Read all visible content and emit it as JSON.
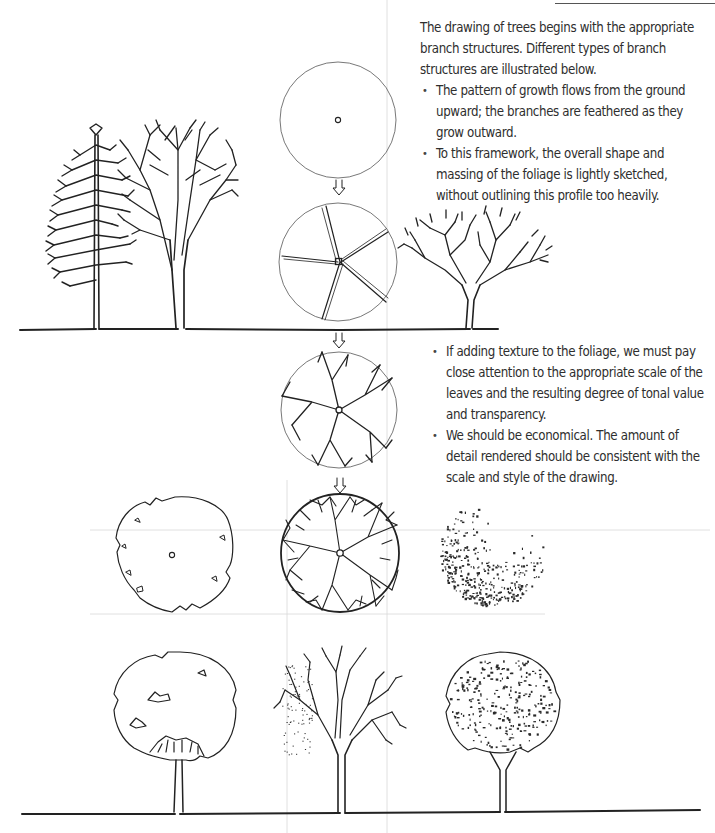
{
  "page": {
    "header_fragment": "...",
    "intro_paragraph": "The drawing of trees begins with the appropriate branch structures. Different types of branch structures are illustrated below.",
    "section1_bullets": [
      "The pattern of growth flows from the ground upward; the branches are feathered as they grow outward.",
      "To this framework, the overall shape and massing of the foliage is lightly sketched, without outlining this profile too heavily."
    ],
    "section2_bullets": [
      "If adding texture to the foliage, we must pay close attention to the appropriate scale of the leaves and the resulting degree of tonal value and transparency.",
      "We should be economical. The amount of detail rendered should be consistent with the scale and style of the drawing."
    ]
  },
  "illustrations": {
    "elevation_row_1": [
      "conifer-branch-structure",
      "deciduous-branch-structure",
      "spreading-canopy-branch-structure"
    ],
    "plan_sequence": [
      "plan-circle-with-trunk",
      "plan-primary-branches",
      "plan-secondary-branches",
      "plan-full-branching"
    ],
    "plan_row": [
      "plan-foliage-outline",
      "plan-branching-full",
      "plan-foliage-texture"
    ],
    "elevation_row_2": [
      "foliage-outline-elevation",
      "branch-structure-elevation",
      "textured-foliage-elevation"
    ]
  },
  "colors": {
    "ink": "#222222",
    "text": "#2e2e2e",
    "guide": "#d8d8d8",
    "background": "#ffffff"
  }
}
